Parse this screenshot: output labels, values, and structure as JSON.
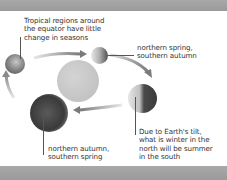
{
  "diagram": {
    "colors": {
      "band": "#a0a0a0",
      "sun": "#c8c8c8",
      "text": "#333333",
      "arrow": "#8a8a8a"
    },
    "labels": {
      "tropical": "Tropical regions around\nthe equator have little\nchange in seasons",
      "spring_top": "northern spring,\nsouthern autumn",
      "tilt": "Due to Earth's tilt,\nwhat is winter in the\nnorth will be summer\nin the south",
      "autumn_bottom": "northern autumn,\nsouthern spring"
    },
    "nodes": [
      {
        "id": "sun",
        "label": "Sun"
      },
      {
        "id": "earth-left",
        "label": "Earth (left position)"
      },
      {
        "id": "earth-top",
        "label": "Earth (top position)"
      },
      {
        "id": "earth-right",
        "label": "Earth (right position)"
      },
      {
        "id": "earth-bottom",
        "label": "Earth (bottom position)"
      }
    ],
    "edges": [
      {
        "from": "earth-left",
        "to": "earth-top"
      },
      {
        "from": "earth-top",
        "to": "earth-right"
      },
      {
        "from": "earth-right",
        "to": "earth-bottom"
      },
      {
        "from": "earth-bottom",
        "to": "earth-left"
      }
    ]
  }
}
